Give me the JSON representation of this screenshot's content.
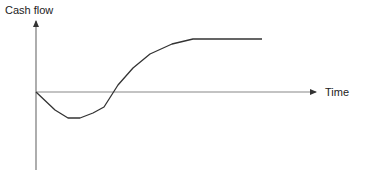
{
  "chart_data": {
    "type": "line",
    "title": "",
    "xlabel": "Time",
    "ylabel": "Cash flow",
    "grid": false,
    "legend": null,
    "ticks": {
      "x": [],
      "y": []
    },
    "note": "Schematic J-curve: initial negative cash flow dipping below zero, recovering, crossing zero, then leveling off at a positive plateau. No numeric scale shown.",
    "series": [
      {
        "name": "Cash flow",
        "color": "#333333",
        "points_px": [
          [
            36,
            92
          ],
          [
            55,
            110
          ],
          [
            68,
            118
          ],
          [
            80,
            118
          ],
          [
            93,
            113
          ],
          [
            104,
            107
          ],
          [
            118,
            85
          ],
          [
            133,
            68
          ],
          [
            150,
            54
          ],
          [
            172,
            44
          ],
          [
            193,
            39
          ],
          [
            262,
            39
          ]
        ],
        "relative_values": [
          0,
          -0.33,
          -0.48,
          -0.48,
          -0.39,
          -0.28,
          0.13,
          0.44,
          0.7,
          0.89,
          0.98,
          0.98
        ]
      }
    ],
    "axes": {
      "x_axis_y_px": 92,
      "x_range_px": [
        36,
        316
      ],
      "y_axis_x_px": 36,
      "y_range_px": [
        18,
        170
      ]
    }
  },
  "labels": {
    "y_axis": "Cash flow",
    "x_axis": "Time"
  }
}
